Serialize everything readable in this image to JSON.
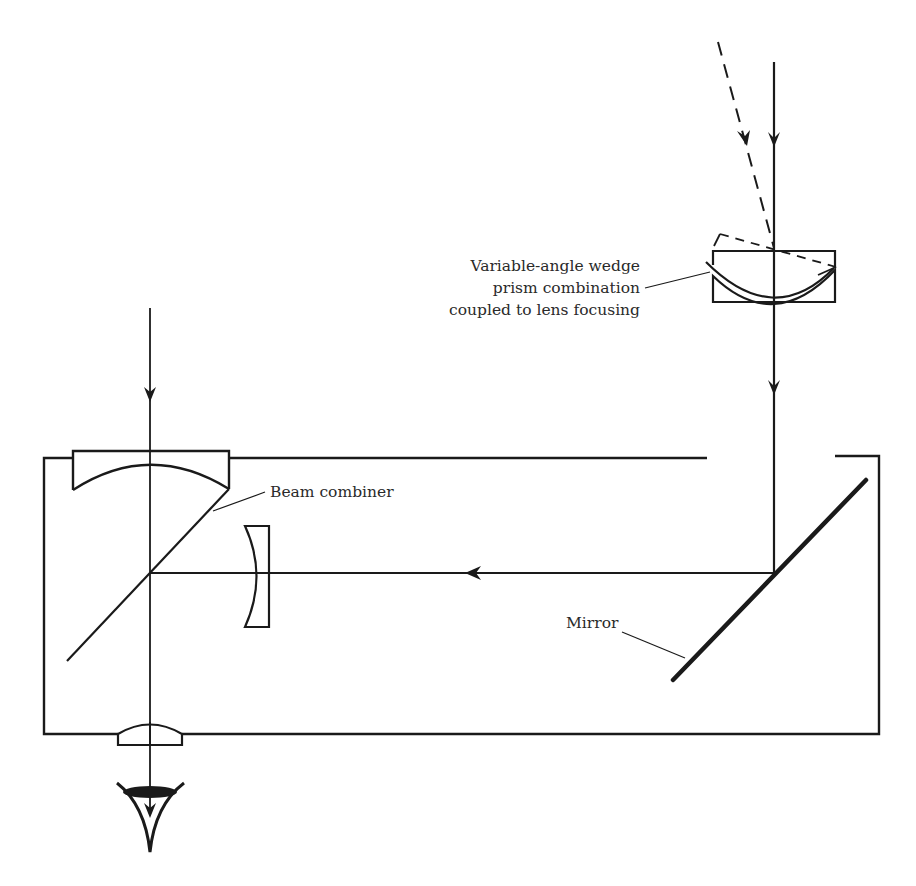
{
  "diagram": {
    "title": "",
    "colors": {
      "line": "#1a1a1a",
      "text": "#2a2a2a",
      "background": "#ffffff"
    },
    "labels": {
      "wedge_prism": [
        "Variable-angle wedge",
        "prism combination",
        "coupled to lens focusing"
      ],
      "beam_combiner": "Beam combiner",
      "mirror": "Mirror"
    },
    "components": [
      "incoming-ray-solid",
      "incoming-ray-dashed",
      "variable-angle-wedge-prism",
      "housing-box",
      "objective-lens-top",
      "beam-combiner",
      "concave-lens",
      "fold-mirror",
      "eyepiece-lens",
      "eye"
    ]
  }
}
